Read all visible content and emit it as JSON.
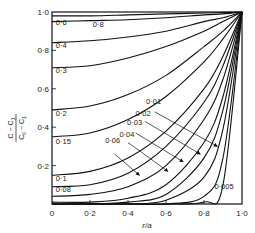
{
  "chart_data": {
    "type": "line",
    "title": "",
    "xlabel": "r/a",
    "ylabel": "(C − C1)/(C0 − C1)",
    "ylabel_parts": {
      "num": "C − C",
      "num_sub": "1",
      "den": "C",
      "den_sub0": "0",
      "den_mid": " − C",
      "den_sub1": "1"
    },
    "xlim": [
      0,
      1.0
    ],
    "ylim": [
      0,
      1.0
    ],
    "x_ticks": [
      0,
      0.2,
      0.4,
      0.6,
      0.8,
      1.0
    ],
    "x_tick_labels": [
      "0",
      "0·2",
      "0·4",
      "0·6",
      "0·8",
      "1·0"
    ],
    "y_ticks": [
      0,
      0.2,
      0.4,
      0.6,
      0.8,
      1.0
    ],
    "y_tick_labels": [
      "0",
      "0·2",
      "0·4",
      "0·6",
      "0·8",
      "1·0"
    ],
    "grid": false,
    "legend": "inline labels (Dt/a² values)",
    "x": [
      0,
      0.2,
      0.4,
      0.6,
      0.8,
      0.9,
      1.0
    ],
    "series": [
      {
        "name": "0·8",
        "values": [
          0.98,
          0.98,
          0.985,
          0.99,
          0.995,
          0.997,
          1.0
        ]
      },
      {
        "name": "0·6",
        "values": [
          0.95,
          0.955,
          0.96,
          0.97,
          0.985,
          0.99,
          1.0
        ]
      },
      {
        "name": "0·4",
        "values": [
          0.84,
          0.85,
          0.87,
          0.9,
          0.95,
          0.97,
          1.0
        ]
      },
      {
        "name": "0·3",
        "values": [
          0.71,
          0.72,
          0.76,
          0.82,
          0.9,
          0.95,
          1.0
        ]
      },
      {
        "name": "0·2",
        "values": [
          0.49,
          0.51,
          0.57,
          0.67,
          0.82,
          0.9,
          1.0
        ]
      },
      {
        "name": "0·15",
        "values": [
          0.35,
          0.37,
          0.44,
          0.56,
          0.74,
          0.86,
          1.0
        ]
      },
      {
        "name": "0·1",
        "values": [
          0.15,
          0.17,
          0.24,
          0.38,
          0.6,
          0.77,
          1.0
        ]
      },
      {
        "name": "0·08",
        "values": [
          0.09,
          0.1,
          0.16,
          0.3,
          0.53,
          0.72,
          1.0
        ]
      },
      {
        "name": "0·06",
        "values": [
          0.04,
          0.05,
          0.09,
          0.2,
          0.44,
          0.65,
          1.0
        ]
      },
      {
        "name": "0·04",
        "values": [
          0.01,
          0.01,
          0.03,
          0.1,
          0.32,
          0.56,
          1.0
        ]
      },
      {
        "name": "0·03",
        "values": [
          0.0,
          0.0,
          0.01,
          0.05,
          0.24,
          0.49,
          1.0
        ]
      },
      {
        "name": "0·02",
        "values": [
          0.0,
          0.0,
          0.0,
          0.02,
          0.14,
          0.39,
          1.0
        ]
      },
      {
        "name": "0·01",
        "values": [
          0.0,
          0.0,
          0.0,
          0.0,
          0.04,
          0.24,
          1.0
        ]
      },
      {
        "name": "0·005",
        "values": [
          0.0,
          0.0,
          0.0,
          0.0,
          0.01,
          0.1,
          1.0
        ]
      }
    ],
    "inline_labels": [
      {
        "text": "0·6",
        "x": 0.02,
        "y": 0.93
      },
      {
        "text": "0·8",
        "x": 0.215,
        "y": 0.92
      },
      {
        "text": "0·4",
        "x": 0.02,
        "y": 0.81
      },
      {
        "text": "0·3",
        "x": 0.02,
        "y": 0.68
      },
      {
        "text": "0·2",
        "x": 0.02,
        "y": 0.46
      },
      {
        "text": "0·15",
        "x": 0.02,
        "y": 0.31
      },
      {
        "text": "0·1",
        "x": 0.02,
        "y": 0.12
      },
      {
        "text": "0·08",
        "x": 0.02,
        "y": 0.06
      },
      {
        "text": "0·06",
        "x": 0.28,
        "y": 0.32
      },
      {
        "text": "0·04",
        "x": 0.355,
        "y": 0.35
      },
      {
        "text": "0·03",
        "x": 0.395,
        "y": 0.41
      },
      {
        "text": "0·02",
        "x": 0.44,
        "y": 0.46
      },
      {
        "text": "0·01",
        "x": 0.495,
        "y": 0.52
      },
      {
        "text": "0·005",
        "x": 0.855,
        "y": 0.08
      }
    ],
    "annotations": [
      {
        "type": "arrow",
        "from": [
          0.54,
          0.48
        ],
        "to": [
          0.87,
          0.3
        ]
      },
      {
        "type": "arrow",
        "from": [
          0.49,
          0.43
        ],
        "to": [
          0.78,
          0.26
        ]
      },
      {
        "type": "arrow",
        "from": [
          0.44,
          0.37
        ],
        "to": [
          0.69,
          0.22
        ]
      },
      {
        "type": "arrow",
        "from": [
          0.4,
          0.32
        ],
        "to": [
          0.61,
          0.17
        ]
      },
      {
        "type": "arrow",
        "from": [
          0.33,
          0.26
        ],
        "to": [
          0.46,
          0.15
        ]
      }
    ]
  }
}
